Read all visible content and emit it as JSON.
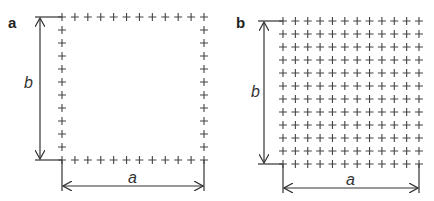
{
  "panels": [
    {
      "id": "a",
      "label": "a",
      "pattern": "perimeter",
      "grid": {
        "cols": 12,
        "rows": 12,
        "x0": 62,
        "x1": 204,
        "y0": 17,
        "y1": 160
      },
      "dimension_labels": {
        "horizontal": "a",
        "vertical": "b"
      }
    },
    {
      "id": "b",
      "label": "b",
      "pattern": "full",
      "grid": {
        "cols": 12,
        "rows": 12,
        "x0": 283,
        "x1": 419,
        "y0": 21,
        "y1": 164
      },
      "dimension_labels": {
        "horizontal": "a",
        "vertical": "b"
      }
    }
  ],
  "colors": {
    "stroke": "#333333",
    "plus": "#444444",
    "text": "#222222"
  }
}
